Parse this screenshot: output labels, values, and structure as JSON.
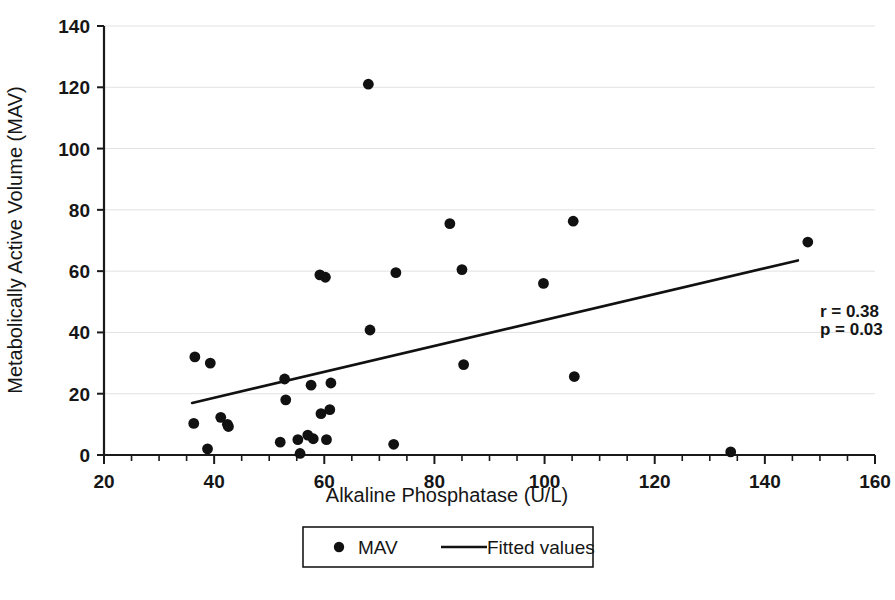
{
  "chart_data": {
    "type": "scatter",
    "title": "",
    "xlabel": "Alkaline Phosphatase  (U/L)",
    "ylabel": "Metabolically Active Volume (MAV)",
    "xlim": [
      20,
      160
    ],
    "ylim": [
      0,
      140
    ],
    "xticks": [
      20,
      40,
      60,
      80,
      100,
      120,
      140,
      160
    ],
    "yticks": [
      0,
      20,
      40,
      60,
      80,
      100,
      120,
      140
    ],
    "xtick_labels": [
      "20",
      "40",
      "60",
      "80",
      "100",
      "120",
      "140",
      "160"
    ],
    "ytick_labels": [
      "0",
      "20",
      "40",
      "60",
      "80",
      "100",
      "120",
      "140"
    ],
    "x_minor_tick_step": 5,
    "grid": "horizontal",
    "grid_color": "#e2e2e2",
    "axis_color": "#1a1a1a",
    "marker_color": "#111111",
    "line_color": "#111111",
    "legend_position": "below-axes",
    "series": [
      {
        "name": "MAV",
        "type": "scatter",
        "marker": "circle",
        "points": [
          [
            36.5,
            32.0
          ],
          [
            36.3,
            10.3
          ],
          [
            38.8,
            2.0
          ],
          [
            39.3,
            30.0
          ],
          [
            41.2,
            12.3
          ],
          [
            42.4,
            10.0
          ],
          [
            42.6,
            9.3
          ],
          [
            52.0,
            4.2
          ],
          [
            52.8,
            24.8
          ],
          [
            53.0,
            18.0
          ],
          [
            55.2,
            5.0
          ],
          [
            55.6,
            0.5
          ],
          [
            57.0,
            6.5
          ],
          [
            57.6,
            22.8
          ],
          [
            58.0,
            5.3
          ],
          [
            59.2,
            58.8
          ],
          [
            59.4,
            13.5
          ],
          [
            60.2,
            58.0
          ],
          [
            60.4,
            5.0
          ],
          [
            61.0,
            14.8
          ],
          [
            61.2,
            23.5
          ],
          [
            68.0,
            121.0
          ],
          [
            68.3,
            40.8
          ],
          [
            72.6,
            3.5
          ],
          [
            73.0,
            59.5
          ],
          [
            82.8,
            75.5
          ],
          [
            85.0,
            60.5
          ],
          [
            85.3,
            29.5
          ],
          [
            99.8,
            56.0
          ],
          [
            105.2,
            76.3
          ],
          [
            105.4,
            25.6
          ],
          [
            133.8,
            1.0
          ],
          [
            147.8,
            69.5
          ]
        ]
      },
      {
        "name": "Fitted values",
        "type": "line",
        "x_start": 36.0,
        "y_start": 17.0,
        "x_end": 146.0,
        "y_end": 63.5
      }
    ],
    "annotations": [
      {
        "text": "r = 0.38",
        "x": 150,
        "y": 45
      },
      {
        "text": "p = 0.03",
        "x": 150,
        "y": 39
      }
    ]
  },
  "legend": {
    "items": [
      {
        "label": "MAV",
        "marker": "circle"
      },
      {
        "label": "Fitted values",
        "marker": "line"
      }
    ]
  }
}
